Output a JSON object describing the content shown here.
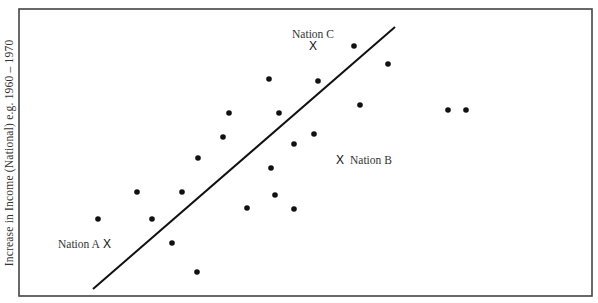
{
  "chart_data": {
    "type": "scatter",
    "title": "",
    "xlabel": "",
    "ylabel": "Increase in Income (National) e.g. 1960 – 1970",
    "axes": {
      "x_ticks": [],
      "y_ticks": [],
      "grid": false,
      "frame": true
    },
    "coordinate_note": "Positions are image-pixel coordinates inside the plot frame (no numeric axis scale shown)",
    "frame": {
      "x0": 19,
      "y0": 9,
      "x1": 592,
      "y1": 296
    },
    "trend_line": {
      "x1": 93,
      "y1": 289,
      "x2": 395,
      "y2": 27
    },
    "points": [
      {
        "x": 98,
        "y": 219
      },
      {
        "x": 137,
        "y": 192
      },
      {
        "x": 152,
        "y": 219
      },
      {
        "x": 172,
        "y": 243
      },
      {
        "x": 182,
        "y": 192
      },
      {
        "x": 197,
        "y": 272
      },
      {
        "x": 198,
        "y": 158
      },
      {
        "x": 223,
        "y": 137
      },
      {
        "x": 229,
        "y": 113
      },
      {
        "x": 247,
        "y": 208
      },
      {
        "x": 269,
        "y": 79
      },
      {
        "x": 271,
        "y": 168
      },
      {
        "x": 275,
        "y": 195
      },
      {
        "x": 279,
        "y": 113
      },
      {
        "x": 294,
        "y": 144
      },
      {
        "x": 294,
        "y": 209
      },
      {
        "x": 314,
        "y": 134
      },
      {
        "x": 318,
        "y": 81
      },
      {
        "x": 354,
        "y": 46
      },
      {
        "x": 360,
        "y": 105
      },
      {
        "x": 388,
        "y": 64
      },
      {
        "x": 448,
        "y": 110
      },
      {
        "x": 466,
        "y": 110
      }
    ],
    "annotations": [
      {
        "label": "Nation A",
        "marker": "X",
        "x": 107,
        "y": 244,
        "label_x": 58,
        "label_y": 248,
        "label_anchor": "start"
      },
      {
        "label": "Nation B",
        "marker": "X",
        "x": 340,
        "y": 160,
        "label_x": 350,
        "label_y": 164,
        "label_anchor": "start"
      },
      {
        "label": "Nation C",
        "marker": "X",
        "x": 313,
        "y": 46,
        "label_x": 313,
        "label_y": 38,
        "label_anchor": "middle"
      }
    ]
  },
  "colors": {
    "ink": "#111111",
    "frame": "#444444",
    "label": "#333333",
    "background": "#ffffff"
  }
}
